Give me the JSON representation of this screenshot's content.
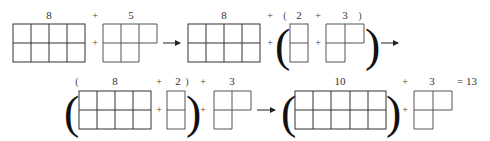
{
  "row1": {
    "labels": {
      "term_a": "8",
      "plus_1": "+",
      "term_b": "5",
      "term_c": "8",
      "plus_2": "+",
      "open_paren": "(",
      "term_d": "2",
      "plus_3": "+",
      "term_e": "3",
      "close_paren": ")"
    },
    "operators": {
      "plus": "+"
    }
  },
  "row2": {
    "labels": {
      "open_paren": "(",
      "term_a": "8",
      "plus_1": "+",
      "term_b": "2",
      "close_paren": ")",
      "plus_2": "+",
      "term_c": "3",
      "term_d": "10",
      "plus_3": "+",
      "term_e": "3",
      "result": "= 13"
    },
    "operators": {
      "plus": "+"
    }
  },
  "big_parens": {
    "open": "(",
    "close": ")"
  },
  "colors": {
    "grid_stroke": "#555555",
    "text": "#333333",
    "background": "#ffffff"
  }
}
